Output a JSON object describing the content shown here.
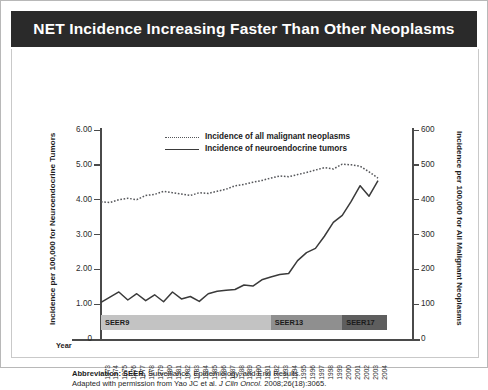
{
  "title": "NET Incidence Increasing Faster Than Other Neoplasms",
  "axis": {
    "left_label": "Incidence per 100,000 for Neuroendocrine Tumors",
    "right_label": "Incidence per 100,000 for All Malignant Neoplasms",
    "x_label": "Year",
    "left_ticks": [
      "6.00",
      "5.00",
      "4.00",
      "3.00",
      "2.00",
      "1.00",
      "0"
    ],
    "right_ticks": [
      "600",
      "500",
      "400",
      "300",
      "200",
      "100",
      "0"
    ]
  },
  "legend": {
    "items": [
      {
        "label": "Incidence of all malignant neoplasms",
        "style": "dotted",
        "color": "#55565a"
      },
      {
        "label": "Incidence of neuroendocrine tumors",
        "style": "solid",
        "color": "#3a3a3a"
      }
    ]
  },
  "seer_bands": [
    {
      "label": "SEER9",
      "start_year": 1973,
      "end_year": 1991,
      "color": "#c3c3c3"
    },
    {
      "label": "SEER13",
      "start_year": 1992,
      "end_year": 1999,
      "color": "#8f8f8f"
    },
    {
      "label": "SEER17",
      "start_year": 2000,
      "end_year": 2004,
      "color": "#5e5e5e"
    }
  ],
  "footnote": {
    "line1_bold": "Abbreviation: SEER,",
    "line1_rest": " Surveillance, Epidemiology, and End Results.",
    "line2_pre": "Adapted with permission from Yao JC et al. ",
    "line2_italic": "J Clin Oncol.",
    "line2_post": " 2008;26(18):3065."
  },
  "chart_data": {
    "type": "line",
    "title": "NET Incidence Increasing Faster Than Other Neoplasms",
    "xlabel": "Year",
    "ylabel": "Incidence per 100,000 for Neuroendocrine Tumors",
    "y2label": "Incidence per 100,000 for All Malignant Neoplasms",
    "ylim": [
      0,
      6
    ],
    "y2lim": [
      0,
      600
    ],
    "grid": false,
    "legend_position": "top-center",
    "x": [
      1973,
      1974,
      1975,
      1976,
      1977,
      1978,
      1979,
      1980,
      1981,
      1982,
      1983,
      1984,
      1985,
      1986,
      1987,
      1988,
      1989,
      1990,
      1991,
      1992,
      1993,
      1994,
      1995,
      1996,
      1997,
      1998,
      1999,
      2000,
      2001,
      2002,
      2003,
      2004
    ],
    "categories": [
      "1973",
      "1974",
      "1975",
      "1976",
      "1977",
      "1978",
      "1979",
      "1980",
      "1981",
      "1982",
      "1983",
      "1984",
      "1985",
      "1986",
      "1987",
      "1988",
      "1989",
      "1990",
      "1991",
      "1992",
      "1993",
      "1994",
      "1995",
      "1996",
      "1997",
      "1998",
      "1999",
      "2000",
      "2001",
      "2002",
      "2003",
      "2004"
    ],
    "series": [
      {
        "name": "Incidence of neuroendocrine tumors",
        "axis": "left",
        "style": "solid",
        "color": "#3a3a3a",
        "values": [
          1.05,
          1.2,
          1.35,
          1.12,
          1.3,
          1.1,
          1.27,
          1.07,
          1.35,
          1.15,
          1.22,
          1.08,
          1.3,
          1.37,
          1.4,
          1.42,
          1.55,
          1.52,
          1.7,
          1.78,
          1.85,
          1.88,
          2.25,
          2.48,
          2.6,
          2.95,
          3.35,
          3.55,
          3.95,
          4.4,
          4.1,
          4.55
        ]
      },
      {
        "name": "Incidence of all malignant neoplasms",
        "axis": "right",
        "style": "dotted",
        "color": "#55565a",
        "values": [
          394,
          392,
          400,
          404,
          400,
          412,
          415,
          424,
          420,
          416,
          412,
          420,
          418,
          424,
          430,
          440,
          444,
          450,
          455,
          462,
          468,
          466,
          472,
          478,
          485,
          492,
          488,
          502,
          500,
          496,
          480,
          462
        ]
      }
    ]
  }
}
